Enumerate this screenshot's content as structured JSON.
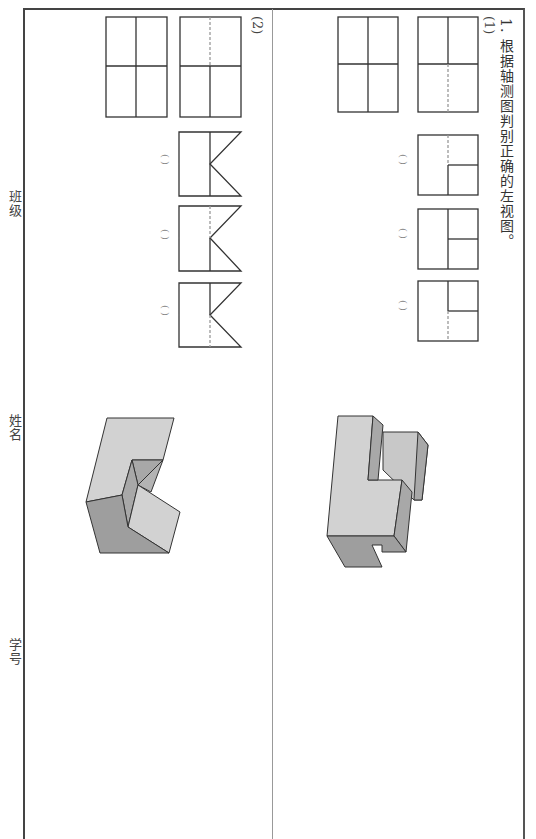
{
  "page": {
    "orientation": "rotated-90-clockwise",
    "side_labels": [
      "班级",
      "姓名",
      "学号"
    ]
  },
  "question": {
    "number": "1.",
    "title": "根据轴测图判别正确的左视图。",
    "parts": [
      {
        "label": "(1)",
        "given_views": [
          "front-view-grid",
          "top-view-grid-dashed"
        ],
        "options": [
          {
            "answer_blank": "(    )",
            "description": "square with dashed vertical, lower-right box"
          },
          {
            "answer_blank": "(    )",
            "description": "square with solid vertical, lower-right box"
          },
          {
            "answer_blank": "(    )",
            "description": "square with upper-right box, dashed lower vertical"
          }
        ],
        "isometric": "L-shaped stepped block"
      },
      {
        "label": "(2)",
        "given_views": [
          "top-view-grid-dashed",
          "front-view-grid"
        ],
        "options": [
          {
            "answer_blank": "(    )",
            "description": "rectangle with solid vertical and V-notch"
          },
          {
            "answer_blank": "(    )",
            "description": "rectangle with dashed upper vertical and V-notch"
          },
          {
            "answer_blank": "(    )",
            "description": "rectangle with dashed lower vertical and V-notch"
          }
        ],
        "isometric": "block with V-groove cut"
      }
    ]
  },
  "colors": {
    "line": "#333333",
    "dashed": "#888888",
    "face_light": "#d4d4d4",
    "face_mid": "#bdbdbd",
    "face_dark": "#9e9e9e"
  }
}
